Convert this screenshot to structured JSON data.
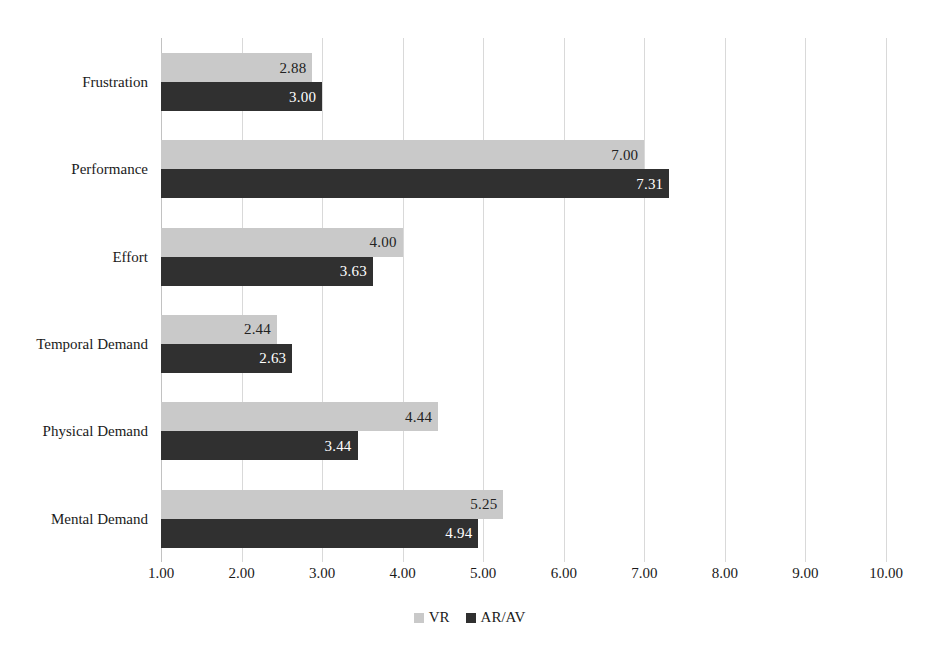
{
  "chart_data": {
    "type": "bar",
    "orientation": "horizontal",
    "title": "",
    "xlabel": "",
    "ylabel": "",
    "xlim": [
      1.0,
      10.0
    ],
    "xticks": [
      "1.00",
      "2.00",
      "3.00",
      "4.00",
      "5.00",
      "6.00",
      "7.00",
      "8.00",
      "9.00",
      "10.00"
    ],
    "xtick_values": [
      1,
      2,
      3,
      4,
      5,
      6,
      7,
      8,
      9,
      10
    ],
    "grid": "vertical",
    "legend_position": "bottom-center",
    "categories": [
      "Frustration",
      "Performance",
      "Effort",
      "Temporal Demand",
      "Physical Demand",
      "Mental Demand"
    ],
    "category_order_top_to_bottom": [
      "Frustration",
      "Performance",
      "Effort",
      "Temporal Demand",
      "Physical Demand",
      "Mental Demand"
    ],
    "series": [
      {
        "name": "VR",
        "color": "#c9c9c9",
        "values": [
          2.88,
          7.0,
          4.0,
          2.44,
          4.44,
          5.25
        ],
        "labels": [
          "2.88",
          "7.00",
          "4.00",
          "2.44",
          "4.44",
          "5.25"
        ]
      },
      {
        "name": "AR/AV",
        "color": "#303030",
        "values": [
          3.0,
          7.31,
          3.63,
          2.63,
          3.44,
          4.94
        ],
        "labels": [
          "3.00",
          "7.31",
          "3.63",
          "2.63",
          "3.44",
          "4.94"
        ]
      }
    ]
  },
  "legend": {
    "items": [
      {
        "label": "VR",
        "color": "#c9c9c9"
      },
      {
        "label": "AR/AV",
        "color": "#303030"
      }
    ]
  },
  "colors": {
    "series_vr": "#c9c9c9",
    "series_ar": "#303030",
    "gridline": "#d9d9d9",
    "axis": "#c2c2c2",
    "text": "#1a1a1a",
    "label_on_dark": "#ffffff",
    "background": "#ffffff"
  }
}
